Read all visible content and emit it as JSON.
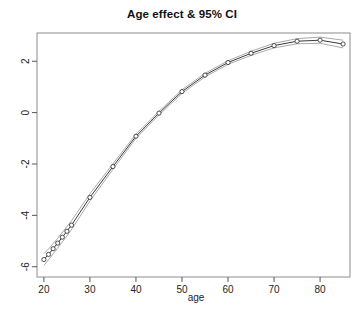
{
  "chart_data": {
    "type": "line",
    "title": "Age effect & 95% CI",
    "xlabel": "age",
    "ylabel": "",
    "xlim": [
      18.5,
      86.5
    ],
    "ylim": [
      -6.4,
      3.1
    ],
    "xticks": [
      20,
      30,
      40,
      50,
      60,
      70,
      80
    ],
    "yticks": [
      2,
      0,
      -2,
      -4,
      -6
    ],
    "grid": false,
    "legend": null,
    "marker": "open-circle",
    "series": [
      {
        "name": "Age effect",
        "x": [
          20,
          21,
          22,
          23,
          24,
          25,
          26,
          30,
          35,
          40,
          45,
          50,
          55,
          60,
          65,
          70,
          75,
          80,
          85
        ],
        "values": [
          -5.72,
          -5.52,
          -5.3,
          -5.08,
          -4.85,
          -4.62,
          -4.38,
          -3.3,
          -2.1,
          -0.92,
          -0.02,
          0.82,
          1.46,
          1.95,
          2.31,
          2.61,
          2.78,
          2.82,
          2.67
        ]
      }
    ],
    "confidence_interval": {
      "label": "95% CI",
      "x": [
        20,
        21,
        22,
        23,
        24,
        25,
        26,
        30,
        35,
        40,
        45,
        50,
        55,
        60,
        65,
        70,
        75,
        80,
        85
      ],
      "lower": [
        -5.95,
        -5.73,
        -5.5,
        -5.27,
        -5.04,
        -4.8,
        -4.55,
        -3.44,
        -2.21,
        -1.0,
        -0.09,
        0.75,
        1.39,
        1.88,
        2.23,
        2.52,
        2.68,
        2.7,
        2.52
      ],
      "upper": [
        -5.49,
        -5.31,
        -5.1,
        -4.89,
        -4.66,
        -4.44,
        -4.21,
        -3.16,
        -1.99,
        -0.84,
        0.05,
        0.89,
        1.53,
        2.02,
        2.39,
        2.7,
        2.88,
        2.94,
        2.82
      ]
    }
  }
}
